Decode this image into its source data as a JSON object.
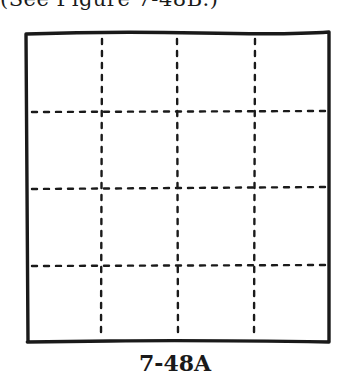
{
  "caption_top": "(See Figure 7-48B.)",
  "figure": {
    "label": "7-48A",
    "grid": {
      "rows": 4,
      "cols": 4,
      "border": {
        "left": 26,
        "top": 33,
        "right": 329,
        "bottom": 342
      },
      "vertical_dashed_x": [
        102,
        177,
        255
      ],
      "horizontal_dashed_y": [
        112,
        189,
        266
      ],
      "stroke_color": "#1a1a1a"
    }
  }
}
